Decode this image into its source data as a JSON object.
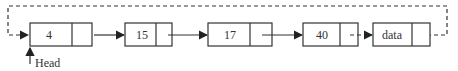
{
  "diagram": {
    "type": "circular-linked-list",
    "nodes": [
      {
        "value": "4"
      },
      {
        "value": "15"
      },
      {
        "value": "17"
      },
      {
        "value": "40"
      },
      {
        "value": "data"
      }
    ],
    "head_label": "Head",
    "colors": {
      "stroke": "#222222",
      "background": "#ffffff"
    }
  }
}
